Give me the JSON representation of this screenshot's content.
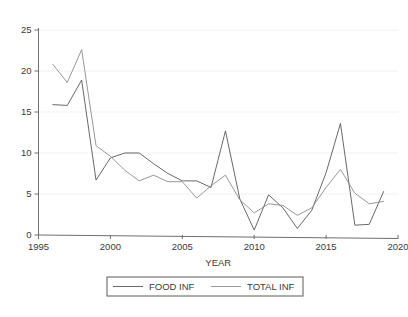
{
  "chart_data": {
    "type": "line",
    "title": "",
    "xlabel": "YEAR",
    "ylabel": "",
    "xlim": [
      1995,
      2020
    ],
    "ylim": [
      0,
      25
    ],
    "xticks": [
      1995,
      2000,
      2005,
      2010,
      2015,
      2020
    ],
    "yticks": [
      0,
      5,
      10,
      15,
      20,
      25
    ],
    "grid": true,
    "legend_position": "bottom",
    "x": [
      1996,
      1997,
      1998,
      1999,
      2000,
      2001,
      2002,
      2003,
      2004,
      2005,
      2006,
      2007,
      2008,
      2009,
      2010,
      2011,
      2012,
      2013,
      2014,
      2015,
      2016,
      2017,
      2018,
      2019
    ],
    "series": [
      {
        "name": "FOOD INF",
        "color": "#585858",
        "values": [
          15.9,
          15.8,
          18.9,
          6.7,
          9.4,
          10.0,
          10.0,
          8.7,
          7.5,
          6.6,
          6.6,
          5.8,
          12.7,
          4.4,
          0.6,
          4.9,
          3.3,
          0.8,
          3.0,
          7.6,
          13.6,
          1.2,
          1.3,
          5.3
        ]
      },
      {
        "name": "TOTAL INF",
        "color": "#8c8c8c",
        "values": [
          20.8,
          18.6,
          22.6,
          10.9,
          9.6,
          7.9,
          6.6,
          7.3,
          6.5,
          6.5,
          4.5,
          6.0,
          7.3,
          4.3,
          2.7,
          3.8,
          3.6,
          2.4,
          3.3,
          5.8,
          8.0,
          5.1,
          3.8,
          4.1
        ]
      }
    ],
    "legend": [
      {
        "label": "FOOD INF",
        "color": "#585858"
      },
      {
        "label": "TOTAL INF",
        "color": "#8c8c8c"
      }
    ]
  },
  "axes": {
    "x_tick_labels": [
      "1995",
      "2000",
      "2005",
      "2010",
      "2015",
      "2020"
    ],
    "y_tick_labels": [
      "0",
      "5",
      "10",
      "15",
      "20",
      "25"
    ],
    "x_axis_title": "YEAR"
  }
}
